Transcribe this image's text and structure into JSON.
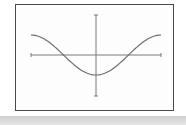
{
  "chart_data": {
    "type": "line",
    "title": "",
    "xlabel": "",
    "ylabel": "",
    "function": "-cos(x)",
    "x": [
      -3.14,
      -2.36,
      -1.57,
      -0.79,
      0,
      0.79,
      1.57,
      2.36,
      3.14
    ],
    "series": [
      {
        "name": "curve",
        "values": [
          1,
          0.71,
          0,
          -0.71,
          -1,
          -0.71,
          0,
          0.71,
          1
        ]
      }
    ],
    "xlim": [
      -3.6,
      3.6
    ],
    "ylim": [
      -1.9,
      1.9
    ],
    "grid": false,
    "legend": "none"
  },
  "colors": {
    "axis": "#7a7a7a",
    "curve": "#6e6e6e",
    "frame": "#4a4a4a"
  }
}
